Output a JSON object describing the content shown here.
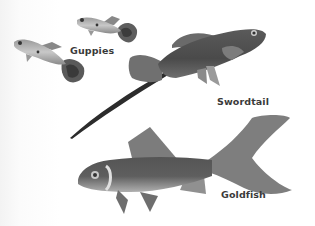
{
  "figure": {
    "labels": [
      {
        "id": "guppies",
        "text": "Guppies"
      },
      {
        "id": "swordtail",
        "text": "Swordtail"
      },
      {
        "id": "goldfish",
        "text": "Goldfish"
      }
    ],
    "colors": {
      "background": "#ffffff",
      "fish_dark": "#4a4a4a",
      "fish_mid": "#7a7a7a",
      "fish_light": "#b5b5b5",
      "label_text": "#3a3a3a"
    }
  }
}
